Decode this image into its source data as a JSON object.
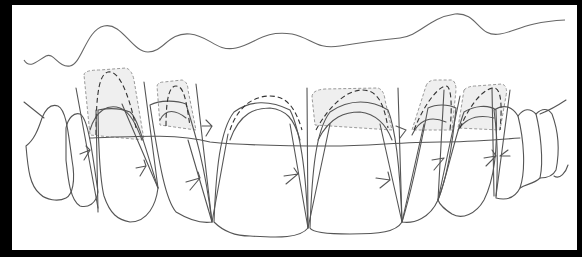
{
  "figure": {
    "type": "dental smile diagram",
    "colors": {
      "background": "#000000",
      "panel": "#ffffff",
      "line": "#555555",
      "shade": "#efefef",
      "dashed": "#333333"
    },
    "elements": {
      "gingival_line": "wavy upper contour",
      "teeth_count": 12,
      "shaded_zones": 5,
      "arrows": 10
    }
  }
}
